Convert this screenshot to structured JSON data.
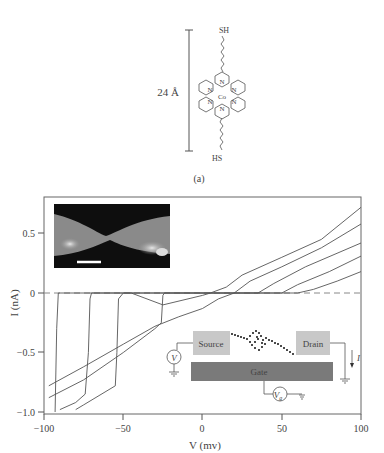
{
  "panel_a": {
    "label": "(a)",
    "length_label": "24 Å",
    "top_group": "SH",
    "bottom_group": "HS",
    "metal_center": "Co",
    "nitrogen_label": "N"
  },
  "inset_image": {
    "description": "SEM-like micrograph of a bowtie electrode gap",
    "scale_bar": true
  },
  "circuit": {
    "source_label": "Source",
    "drain_label": "Drain",
    "gate_label": "Gate",
    "voltmeter_label": "V",
    "gate_voltage_label": "V",
    "gate_voltage_sub": "g",
    "current_label": "I"
  },
  "chart_data": {
    "type": "line",
    "title": "",
    "xlabel": "V (mv)",
    "ylabel": "I (nA)",
    "xlim": [
      -100,
      100
    ],
    "ylim": [
      -1.0,
      0.75
    ],
    "xticks": [
      -100,
      -50,
      0,
      50,
      100
    ],
    "xtick_labels": [
      "−100",
      "−50",
      "0",
      "50",
      "100"
    ],
    "yticks": [
      0.5,
      0,
      -0.5,
      -1.0
    ],
    "ytick_labels": [
      "0.5",
      "0",
      "−0.5",
      "−1.0"
    ],
    "grid": false,
    "reference_line": {
      "y": 0,
      "style": "dashed"
    },
    "series": [
      {
        "name": "curve 1",
        "points": [
          [
            -93,
            -1.0
          ],
          [
            -92,
            -0.3
          ],
          [
            -91,
            0
          ],
          [
            -50,
            0
          ],
          [
            -45,
            0
          ],
          [
            -25,
            -0.1
          ],
          [
            0,
            -0.02
          ],
          [
            5,
            0.0
          ],
          [
            15,
            0.05
          ],
          [
            25,
            0.15
          ],
          [
            50,
            0.3
          ],
          [
            75,
            0.45
          ],
          [
            100,
            0.72
          ]
        ]
      },
      {
        "name": "curve 2",
        "points": [
          [
            -90,
            -0.98
          ],
          [
            -80,
            -0.92
          ],
          [
            -74,
            -0.85
          ],
          [
            -72,
            -0.5
          ],
          [
            -71,
            -0.05
          ],
          [
            -70,
            0
          ],
          [
            20,
            0
          ],
          [
            30,
            0.1
          ],
          [
            50,
            0.22
          ],
          [
            75,
            0.38
          ],
          [
            100,
            0.58
          ]
        ]
      },
      {
        "name": "curve 3",
        "points": [
          [
            -80,
            -0.98
          ],
          [
            -75,
            -0.94
          ],
          [
            -55,
            -0.78
          ],
          [
            -54,
            -0.5
          ],
          [
            -53,
            -0.05
          ],
          [
            -50,
            0
          ],
          [
            35,
            0
          ],
          [
            45,
            0.08
          ],
          [
            65,
            0.22
          ],
          [
            100,
            0.42
          ]
        ]
      },
      {
        "name": "curve 4",
        "points": [
          [
            -97,
            -0.88
          ],
          [
            -75,
            -0.73
          ],
          [
            -50,
            -0.5
          ],
          [
            -30,
            -0.3
          ],
          [
            -26,
            -0.25
          ],
          [
            -25,
            -0.02
          ],
          [
            -24,
            0
          ],
          [
            50,
            0
          ],
          [
            60,
            0.07
          ],
          [
            80,
            0.18
          ],
          [
            100,
            0.31
          ]
        ]
      },
      {
        "name": "curve 5",
        "points": [
          [
            -97,
            -0.78
          ],
          [
            -75,
            -0.62
          ],
          [
            -50,
            -0.43
          ],
          [
            -30,
            -0.28
          ],
          [
            -15,
            -0.2
          ],
          [
            0,
            -0.13
          ],
          [
            10,
            -0.05
          ],
          [
            20,
            0
          ],
          [
            60,
            0
          ],
          [
            70,
            0.03
          ],
          [
            85,
            0.1
          ],
          [
            100,
            0.18
          ]
        ]
      }
    ]
  }
}
